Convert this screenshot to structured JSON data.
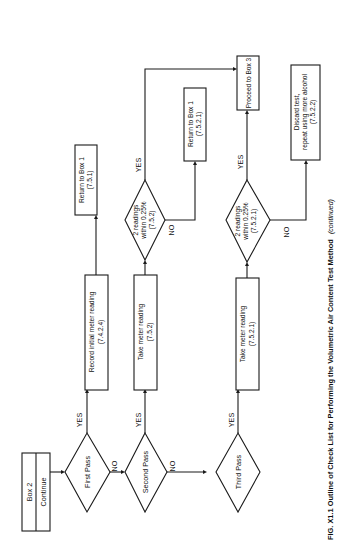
{
  "diagram": {
    "orientation": "rotated 90deg counter-clockwise (landscape figure on portrait page)",
    "start_box": {
      "title": "Box 2",
      "subtitle": "Continue"
    },
    "decisions": {
      "first_pass": "First Pass",
      "second_pass": "Second Pass",
      "third_pass": "Third Pass",
      "readings_a": {
        "line1": "2 readings",
        "line2": "within 0.25%",
        "line3": "(7.5.2)"
      },
      "readings_b": {
        "line1": "2 readings",
        "line2": "within 0.25%",
        "line3": "(7.5.2.1)"
      }
    },
    "processes": {
      "record_initial": {
        "line1": "Record initial meter reading",
        "line2": "(7.4.2.4)"
      },
      "take_meter_a": {
        "line1": "Take meter reading",
        "line2": "(7.5.2)"
      },
      "take_meter_b": {
        "line1": "Take meter reading",
        "line2": "(7.5.2.1)"
      },
      "return_box1_a": {
        "line1": "Return to Box 1",
        "line2": "(7.5.1)"
      },
      "return_box1_b": {
        "line1": "Return to Box 1",
        "line2": "(7.5.2.1)"
      },
      "proceed_box3": {
        "line1": "Proceed to Box 3"
      },
      "discard": {
        "line1": "Discard test,",
        "line2": "repeat using more alcohol",
        "line3": "(7.5.2.2)"
      }
    },
    "edge_labels": {
      "yes": "YES",
      "no": "NO"
    },
    "caption": {
      "main": "FIG. X1.1 Outline of Check List for Performing the Volumetric Air Content Test Method",
      "suffix": "(continued)"
    }
  }
}
